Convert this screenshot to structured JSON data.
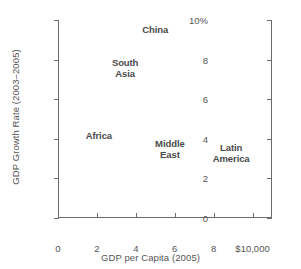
{
  "chart_data": {
    "type": "scatter",
    "title": "",
    "xlabel": "GDP per Capita (2005)",
    "ylabel": "GDP Growth Rate (2003–2005)",
    "xlim": [
      0,
      11
    ],
    "ylim": [
      0,
      10
    ],
    "grid": false,
    "legend": "none",
    "marker_style": "text-label-only",
    "x_unit": "thousands of US dollars",
    "y_unit": "percent",
    "xticks": [
      {
        "value": 0,
        "label": "0"
      },
      {
        "value": 2,
        "label": "2"
      },
      {
        "value": 4,
        "label": "4"
      },
      {
        "value": 6,
        "label": "6"
      },
      {
        "value": 8,
        "label": "8"
      },
      {
        "value": 10,
        "label": "$10,000"
      }
    ],
    "yticks": [
      {
        "value": 0,
        "label": "0"
      },
      {
        "value": 2,
        "label": "2"
      },
      {
        "value": 4,
        "label": "4"
      },
      {
        "value": 6,
        "label": "6"
      },
      {
        "value": 8,
        "label": "8"
      },
      {
        "value": 10,
        "label": "10%"
      }
    ],
    "points": [
      {
        "label": "China",
        "lines": [
          "China"
        ],
        "x": 5.0,
        "y": 9.55
      },
      {
        "label": "South Asia",
        "lines": [
          "South",
          "Asia"
        ],
        "x": 3.45,
        "y": 7.6
      },
      {
        "label": "Africa",
        "lines": [
          "Africa"
        ],
        "x": 2.1,
        "y": 4.2
      },
      {
        "label": "Middle East",
        "lines": [
          "Middle",
          "East"
        ],
        "x": 5.75,
        "y": 3.5
      },
      {
        "label": "Latin America",
        "lines": [
          "Latin",
          "America"
        ],
        "x": 8.9,
        "y": 3.3
      }
    ],
    "colors": {
      "axis": "#6b6b6b",
      "tick_label": "#555555",
      "axis_title": "#555555",
      "point_label": "#4a4a4a",
      "background": "#ffffff"
    }
  }
}
